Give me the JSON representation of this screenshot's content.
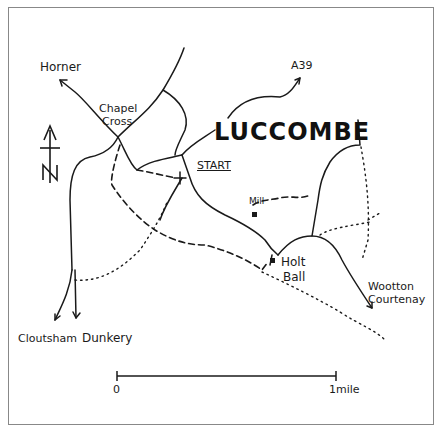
{
  "map": {
    "title": "LUCCOMBE",
    "start_label": "START",
    "place_labels": {
      "horner": "Horner",
      "chapel": "Chapel",
      "cross": "Cross",
      "a39": "A39",
      "mill": "Mill",
      "holt": "Holt",
      "ball": "Ball",
      "wootton": "Wootton",
      "courtenay": "Courtenay",
      "cloutsham": "Cloutsham",
      "dunkery": "Dunkery"
    },
    "north_arrow": "N",
    "scale": {
      "start": "0",
      "end": "1mile"
    },
    "colors": {
      "ink": "#1a1a1a",
      "paper": "#ffffff",
      "border": "#888888"
    }
  }
}
